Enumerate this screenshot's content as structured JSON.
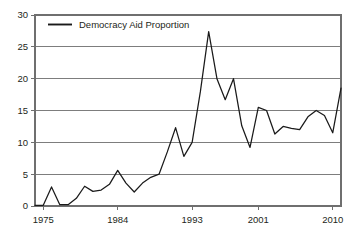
{
  "chart_data": {
    "type": "line",
    "title": "",
    "subtitle": "",
    "xlabel": "",
    "ylabel": "",
    "xlim": [
      1974,
      2011
    ],
    "ylim": [
      0,
      30
    ],
    "grid": "horizontal",
    "legend_position": "top-left",
    "legend": [
      "Democracy Aid Proportion"
    ],
    "yticks": [
      0,
      5,
      10,
      15,
      20,
      25,
      30
    ],
    "ytick_labels": [
      "0",
      "5",
      "10",
      "15",
      "20",
      "25",
      "30"
    ],
    "xticks": [
      1975,
      1984,
      1993,
      2001,
      2010
    ],
    "xtick_labels": [
      "1975",
      "1984",
      "1993",
      "2001",
      "2010"
    ],
    "series": [
      {
        "name": "Democracy Aid Proportion",
        "color": "#1a1a1a",
        "x": [
          1974,
          1975,
          1976,
          1977,
          1978,
          1979,
          1980,
          1981,
          1982,
          1983,
          1984,
          1985,
          1986,
          1987,
          1988,
          1989,
          1990,
          1991,
          1992,
          1993,
          1994,
          1995,
          1996,
          1997,
          1998,
          1999,
          2000,
          2001,
          2002,
          2003,
          2004,
          2005,
          2006,
          2007,
          2008,
          2009,
          2010,
          2011
        ],
        "values": [
          0.1,
          0.1,
          3.0,
          0.2,
          0.2,
          1.2,
          3.1,
          2.3,
          2.5,
          3.4,
          5.6,
          3.6,
          2.2,
          3.6,
          4.5,
          5.0,
          8.5,
          12.3,
          7.8,
          10.0,
          18.0,
          27.4,
          20.0,
          16.7,
          20.0,
          12.6,
          9.2,
          15.5,
          15.0,
          11.3,
          12.5,
          12.2,
          12.0,
          14.0,
          15.0,
          14.2,
          11.5,
          18.5
        ]
      }
    ]
  },
  "axes": {
    "y_axis_name": "y-axis",
    "x_axis_name": "x-axis"
  }
}
